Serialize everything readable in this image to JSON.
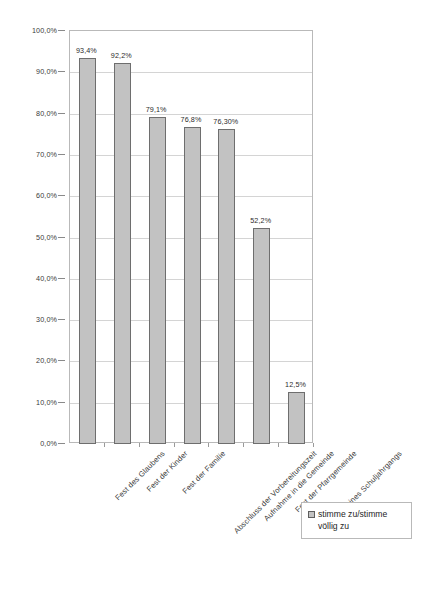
{
  "chart_data": {
    "type": "bar",
    "title": "",
    "xlabel": "",
    "ylabel": "",
    "ylim": [
      0,
      100
    ],
    "grid": true,
    "legend_position": "bottom-right",
    "categories": [
      "Fest des Glaubens",
      "Fest der Kinder",
      "Fest der Familie",
      "Abschluss der Vorbereitungszeit",
      "Aufnahme in die Gemeinde",
      "Fest der Pfarrgemeinde",
      "Fest eines Schuljahrgangs"
    ],
    "series": [
      {
        "name": "stimme zu/stimme völlig zu",
        "values": [
          93.4,
          92.2,
          79.1,
          76.8,
          76.3,
          52.2,
          12.5
        ],
        "value_labels": [
          "93,4%",
          "92,2%",
          "79,1%",
          "76,8%",
          "76,30%",
          "52,2%",
          "12,5%"
        ],
        "color": "#c2c2c2",
        "border_color": "#6e6e6e"
      }
    ],
    "y_ticks": [
      "0,0%",
      "10,0%",
      "20,0%",
      "30,0%",
      "40,0%",
      "50,0%",
      "60,0%",
      "70,0%",
      "80,0%",
      "90,0%",
      "100,0%"
    ],
    "y_tick_values": [
      0,
      10,
      20,
      30,
      40,
      50,
      60,
      70,
      80,
      90,
      100
    ]
  },
  "legend": {
    "entries": [
      {
        "label": "stimme zu/stimme völlig zu",
        "swatch_color": "#c2c2c2"
      }
    ]
  },
  "colors": {
    "bar_fill": "#c2c2c2",
    "bar_border": "#6e6e6e",
    "gridline": "#d4d4d4",
    "plot_border": "#b9b9b9",
    "text": "#3a3a3a",
    "background": "#ffffff"
  }
}
